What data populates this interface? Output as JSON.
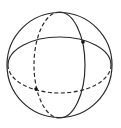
{
  "diagram": {
    "stroke_color": "#2b2b2b",
    "point_color": "#111111",
    "background": "#ffffff",
    "sphere": {
      "cx": 59.5,
      "cy": 65,
      "r": 52.5
    },
    "equator": {
      "cx": 59.5,
      "cy": 65,
      "rx": 51.5,
      "ry": 28,
      "visible_half": "top (solid)",
      "hidden_half": "bottom (dashed)"
    },
    "meridian": {
      "cx": 59.5,
      "cy": 65,
      "rx": 25.5,
      "ry": 53,
      "visible_half": "right (solid)",
      "hidden_half": "left (dashed)"
    },
    "points": [
      {
        "name": "upper-right-intersection",
        "x": 83,
        "y": 42
      },
      {
        "name": "lower-left-intersection",
        "x": 36,
        "y": 89
      }
    ]
  }
}
